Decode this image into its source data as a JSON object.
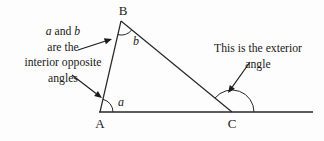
{
  "figure": {
    "background_color": "#fdfdfd",
    "stroke_color": "#262626",
    "text_color": "#1a1a1a"
  },
  "vertices": {
    "A": {
      "label": "A",
      "x": 100,
      "y": 112
    },
    "B": {
      "label": "B",
      "x": 121,
      "y": 21
    },
    "C": {
      "label": "C",
      "x": 232,
      "y": 112
    }
  },
  "baseline": {
    "name": "extended-base-line",
    "x1": 99,
    "y1": 112,
    "x2": 313,
    "y2": 112
  },
  "angles": {
    "a": {
      "label": "a",
      "at_vertex": "A",
      "description": "interior angle at A",
      "arc_radius": 13,
      "label_x": 118,
      "label_y": 106
    },
    "b": {
      "label": "b",
      "at_vertex": "B",
      "description": "interior angle at B",
      "arc_radius": 14,
      "label_x": 133,
      "label_y": 45
    },
    "exterior": {
      "label": "",
      "at_vertex": "C",
      "description": "exterior angle at C",
      "arc_radius": 22
    }
  },
  "annotations": [
    {
      "name": "interior-opposite-angles-note",
      "lines": [
        {
          "segments": [
            {
              "text": "a",
              "italic": true
            },
            {
              "text": " and ",
              "italic": false
            },
            {
              "text": "b",
              "italic": true
            }
          ]
        },
        {
          "segments": [
            {
              "text": "are the",
              "italic": false
            }
          ]
        },
        {
          "segments": [
            {
              "text": "interior opposite",
              "italic": false
            }
          ]
        },
        {
          "segments": [
            {
              "text": "angles",
              "italic": false
            }
          ]
        }
      ],
      "center_x": 63,
      "first_line_y": 35,
      "line_height": 15.5
    },
    {
      "name": "exterior-angle-note",
      "lines": [
        {
          "segments": [
            {
              "text": "This is the exterior",
              "italic": false
            }
          ]
        },
        {
          "segments": [
            {
              "text": "angle",
              "italic": false
            }
          ]
        }
      ],
      "center_x": 258,
      "first_line_y": 52,
      "line_height": 15.5
    }
  ],
  "pointers": [
    {
      "name": "pointer-to-angle-b",
      "x1": 78,
      "y1": 50,
      "x2": 112,
      "y2": 39,
      "target": "b"
    },
    {
      "name": "pointer-to-angle-a",
      "x1": 72,
      "y1": 75,
      "x2": 102,
      "y2": 98,
      "target": "a"
    },
    {
      "name": "pointer-to-exterior-angle",
      "x1": 250,
      "y1": 62,
      "x2": 228,
      "y2": 93,
      "target": "exterior"
    }
  ]
}
